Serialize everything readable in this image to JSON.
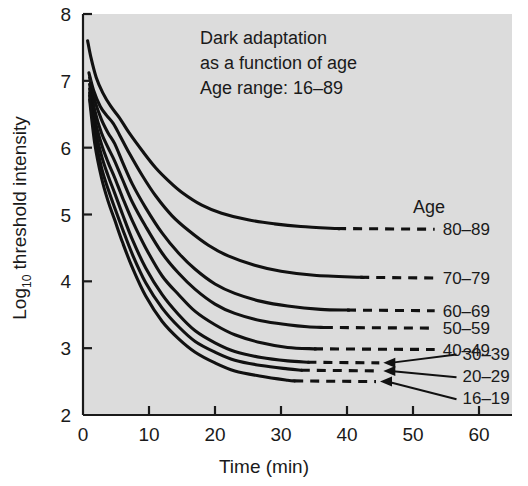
{
  "chart_data": {
    "type": "line",
    "title": "Dark adaptation as a function of age",
    "title_lines": [
      "Dark adaptation",
      "as a function of age",
      "Age range: 16–89"
    ],
    "xlabel": "Time (min)",
    "ylabel_main": "threshold intensity",
    "ylabel_prefix": "Log",
    "ylabel_sub": "10",
    "ylabel_full": "Log10 threshold intensity",
    "xlim": [
      0,
      65
    ],
    "ylim": [
      2,
      8
    ],
    "xticks": [
      0,
      10,
      20,
      30,
      40,
      50,
      60
    ],
    "xtick_labels": [
      "0",
      "10",
      "20",
      "30",
      "40",
      "50",
      "60"
    ],
    "yticks": [
      2,
      3,
      4,
      5,
      6,
      7,
      8
    ],
    "ytick_labels": [
      "2",
      "3",
      "4",
      "5",
      "6",
      "7",
      "8"
    ],
    "grid": false,
    "legend_position": "right",
    "legend_title": "Age",
    "plot_bg": "#dcdcdc",
    "line_color": "#111111",
    "series": [
      {
        "name": "80–89",
        "label": "80–89",
        "dash_start_x": 38.5,
        "label_x": 54.5,
        "label_y": 4.78,
        "arrow": false,
        "points": [
          [
            0.7,
            7.6
          ],
          [
            1.2,
            7.35
          ],
          [
            2.0,
            7.05
          ],
          [
            3.0,
            6.82
          ],
          [
            4.2,
            6.62
          ],
          [
            5.5,
            6.45
          ],
          [
            7.0,
            6.22
          ],
          [
            9.0,
            5.95
          ],
          [
            11.0,
            5.7
          ],
          [
            13.0,
            5.5
          ],
          [
            15.0,
            5.33
          ],
          [
            18.0,
            5.14
          ],
          [
            21.0,
            5.02
          ],
          [
            25.0,
            4.92
          ],
          [
            29.0,
            4.86
          ],
          [
            33.0,
            4.82
          ],
          [
            38.5,
            4.79
          ],
          [
            50.0,
            4.78
          ]
        ]
      },
      {
        "name": "70–79",
        "label": "70–79",
        "dash_start_x": 42.0,
        "label_x": 54.5,
        "label_y": 4.05,
        "arrow": false,
        "points": [
          [
            0.9,
            7.12
          ],
          [
            1.6,
            6.86
          ],
          [
            2.6,
            6.62
          ],
          [
            3.6,
            6.48
          ],
          [
            4.6,
            6.36
          ],
          [
            5.6,
            6.18
          ],
          [
            7.0,
            5.92
          ],
          [
            9.0,
            5.58
          ],
          [
            11.0,
            5.28
          ],
          [
            13.5,
            4.98
          ],
          [
            16.0,
            4.76
          ],
          [
            19.0,
            4.54
          ],
          [
            22.0,
            4.38
          ],
          [
            26.0,
            4.24
          ],
          [
            30.0,
            4.15
          ],
          [
            35.0,
            4.09
          ],
          [
            42.0,
            4.06
          ],
          [
            50.0,
            4.05
          ]
        ]
      },
      {
        "name": "60–69",
        "label": "60–69",
        "dash_start_x": 40.0,
        "label_x": 54.5,
        "label_y": 3.56,
        "arrow": false,
        "points": [
          [
            1.0,
            7.05
          ],
          [
            1.8,
            6.7
          ],
          [
            2.8,
            6.42
          ],
          [
            3.8,
            6.22
          ],
          [
            4.8,
            6.06
          ],
          [
            6.0,
            5.78
          ],
          [
            7.5,
            5.45
          ],
          [
            9.5,
            5.1
          ],
          [
            12.0,
            4.72
          ],
          [
            14.5,
            4.42
          ],
          [
            17.0,
            4.18
          ],
          [
            20.0,
            3.96
          ],
          [
            23.0,
            3.82
          ],
          [
            27.0,
            3.7
          ],
          [
            31.0,
            3.63
          ],
          [
            36.0,
            3.58
          ],
          [
            40.0,
            3.57
          ],
          [
            50.0,
            3.56
          ]
        ]
      },
      {
        "name": "50–59",
        "label": "50–59",
        "dash_start_x": 36.5,
        "label_x": 54.5,
        "label_y": 3.3,
        "arrow": false,
        "points": [
          [
            1.0,
            6.95
          ],
          [
            1.8,
            6.55
          ],
          [
            2.8,
            6.22
          ],
          [
            3.8,
            6.0
          ],
          [
            4.8,
            5.8
          ],
          [
            6.0,
            5.52
          ],
          [
            7.5,
            5.18
          ],
          [
            9.5,
            4.82
          ],
          [
            12.0,
            4.42
          ],
          [
            14.5,
            4.12
          ],
          [
            17.0,
            3.88
          ],
          [
            20.0,
            3.66
          ],
          [
            23.0,
            3.52
          ],
          [
            27.0,
            3.41
          ],
          [
            31.0,
            3.35
          ],
          [
            34.0,
            3.32
          ],
          [
            36.5,
            3.31
          ],
          [
            50.0,
            3.3
          ]
        ]
      },
      {
        "name": "40–49",
        "label": "40–49",
        "dash_start_x": 35.0,
        "label_x": 54.5,
        "label_y": 2.98,
        "arrow": false,
        "points": [
          [
            1.0,
            6.88
          ],
          [
            1.8,
            6.42
          ],
          [
            2.8,
            6.05
          ],
          [
            3.8,
            5.78
          ],
          [
            4.8,
            5.55
          ],
          [
            6.0,
            5.25
          ],
          [
            7.5,
            4.9
          ],
          [
            9.5,
            4.5
          ],
          [
            12.0,
            4.08
          ],
          [
            14.5,
            3.8
          ],
          [
            17.0,
            3.55
          ],
          [
            20.0,
            3.35
          ],
          [
            23.0,
            3.2
          ],
          [
            27.0,
            3.08
          ],
          [
            31.0,
            3.01
          ],
          [
            35.0,
            2.99
          ],
          [
            50.0,
            2.98
          ]
        ]
      },
      {
        "name": "30–39",
        "label": "30–39",
        "dash_start_x": 34.0,
        "label_x": 57.5,
        "label_y": 2.92,
        "arrow": true,
        "arrow_tip_x": 45.5,
        "arrow_tip_y": 2.78,
        "points": [
          [
            1.0,
            6.82
          ],
          [
            1.8,
            6.3
          ],
          [
            2.8,
            5.88
          ],
          [
            3.8,
            5.58
          ],
          [
            4.8,
            5.32
          ],
          [
            6.0,
            5.0
          ],
          [
            7.5,
            4.62
          ],
          [
            9.5,
            4.2
          ],
          [
            12.0,
            3.8
          ],
          [
            14.5,
            3.5
          ],
          [
            17.0,
            3.26
          ],
          [
            20.0,
            3.08
          ],
          [
            23.0,
            2.95
          ],
          [
            27.0,
            2.86
          ],
          [
            31.0,
            2.81
          ],
          [
            34.0,
            2.79
          ],
          [
            50.0,
            2.78
          ]
        ]
      },
      {
        "name": "20–29",
        "label": "20–29",
        "dash_start_x": 33.0,
        "label_x": 57.5,
        "label_y": 2.58,
        "arrow": true,
        "arrow_tip_x": 45.5,
        "arrow_tip_y": 2.66,
        "points": [
          [
            1.0,
            6.78
          ],
          [
            1.8,
            6.18
          ],
          [
            2.8,
            5.7
          ],
          [
            3.8,
            5.38
          ],
          [
            4.8,
            5.1
          ],
          [
            6.0,
            4.78
          ],
          [
            7.5,
            4.4
          ],
          [
            9.5,
            3.98
          ],
          [
            12.0,
            3.6
          ],
          [
            14.5,
            3.32
          ],
          [
            17.0,
            3.1
          ],
          [
            20.0,
            2.94
          ],
          [
            23.0,
            2.82
          ],
          [
            27.0,
            2.74
          ],
          [
            31.0,
            2.69
          ],
          [
            33.0,
            2.67
          ],
          [
            50.0,
            2.66
          ]
        ]
      },
      {
        "name": "16–19",
        "label": "16–19",
        "dash_start_x": 32.0,
        "label_x": 57.5,
        "label_y": 2.25,
        "arrow": true,
        "arrow_tip_x": 45.0,
        "arrow_tip_y": 2.5,
        "points": [
          [
            1.0,
            6.72
          ],
          [
            1.8,
            6.05
          ],
          [
            2.8,
            5.55
          ],
          [
            3.8,
            5.2
          ],
          [
            4.8,
            4.92
          ],
          [
            6.0,
            4.58
          ],
          [
            7.5,
            4.2
          ],
          [
            9.5,
            3.78
          ],
          [
            12.0,
            3.4
          ],
          [
            14.5,
            3.14
          ],
          [
            17.0,
            2.94
          ],
          [
            20.0,
            2.78
          ],
          [
            23.0,
            2.66
          ],
          [
            27.0,
            2.58
          ],
          [
            31.0,
            2.52
          ],
          [
            32.0,
            2.51
          ],
          [
            50.0,
            2.5
          ]
        ]
      }
    ]
  }
}
